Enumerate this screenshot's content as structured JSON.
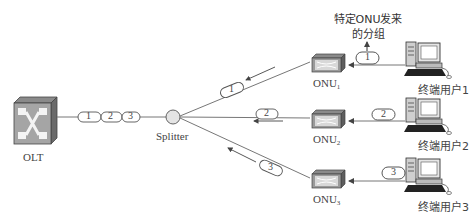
{
  "diagram": {
    "type": "PON upstream TDMA diagram",
    "olt": {
      "label": "OLT"
    },
    "splitter": {
      "label": "Splitter"
    },
    "trunk_packets": [
      "1",
      "2",
      "3"
    ],
    "onus": [
      {
        "label": "ONU",
        "sub": "1",
        "packet": "1"
      },
      {
        "label": "ONU",
        "sub": "2",
        "packet": "2"
      },
      {
        "label": "ONU",
        "sub": "3",
        "packet": "3"
      }
    ],
    "users": [
      {
        "label": "终端用户1"
      },
      {
        "label": "终端用户2"
      },
      {
        "label": "终端用户3"
      }
    ],
    "annotation": {
      "line1": "特定ONU发来",
      "line2": "的分组"
    },
    "colors": {
      "line": "#777777",
      "device_dark": "#5a5a5a",
      "device_face": "#a8a8a8",
      "circle": "#e6e6e6"
    }
  }
}
